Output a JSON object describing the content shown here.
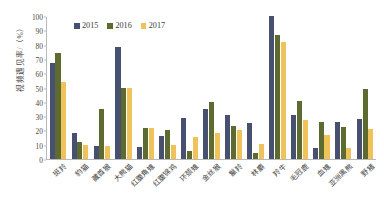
{
  "chart_data": {
    "type": "bar",
    "title": "",
    "xlabel": "",
    "ylabel": "视频遇见率/（%）",
    "ylim": [
      0,
      100
    ],
    "yticks": [
      0,
      10,
      20,
      30,
      40,
      50,
      60,
      70,
      80,
      90,
      100
    ],
    "grid": false,
    "legend_position": "top-left",
    "categories": [
      "斑羚",
      "豹猫",
      "藏酋猴",
      "大熊猫",
      "红腹角雉",
      "红腹锦鸡",
      "环颈雉",
      "金丝猴",
      "鬣羚",
      "林麝",
      "羚牛",
      "毛冠鹿",
      "血雉",
      "亚洲黑熊",
      "野猪"
    ],
    "series": [
      {
        "name": "2015",
        "color": "#48506f",
        "values": [
          67,
          18,
          9,
          78,
          8.5,
          16,
          29,
          35,
          31,
          25,
          100,
          31,
          8,
          26,
          28
        ]
      },
      {
        "name": "2016",
        "color": "#5e6b30",
        "values": [
          74,
          12,
          35,
          50,
          22,
          20,
          5.5,
          40,
          23,
          4.5,
          87,
          40.5,
          26,
          22.5,
          49
        ]
      },
      {
        "name": "2017",
        "color": "#f0c35a",
        "values": [
          54,
          9.5,
          9,
          50,
          21.5,
          9.5,
          15.5,
          18,
          20,
          10.5,
          81.5,
          27,
          17,
          8,
          21
        ]
      }
    ]
  },
  "axis": {
    "y_title": "视频遇见率/（%）"
  }
}
